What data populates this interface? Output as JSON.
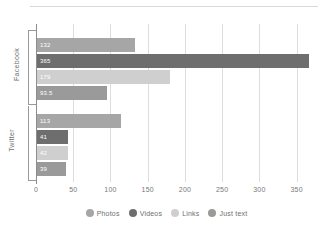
{
  "chart_data": {
    "type": "bar",
    "orientation": "horizontal",
    "title": "",
    "xlabel": "",
    "ylabel": "",
    "categories": [
      "Facebook",
      "Twitter"
    ],
    "series": [
      {
        "name": "Photos",
        "color": "#a6a6a6",
        "values": [
          132,
          113
        ]
      },
      {
        "name": "Videos",
        "color": "#6e6e6e",
        "values": [
          365,
          41
        ]
      },
      {
        "name": "Links",
        "color": "#cfcfcf",
        "values": [
          179,
          42
        ]
      },
      {
        "name": "Just text",
        "color": "#9a9a9a",
        "values": [
          93.5,
          39
        ]
      }
    ],
    "bar_labels": {
      "Facebook": [
        "132",
        "365",
        "179",
        "93.5"
      ],
      "Twitter": [
        "113",
        "41",
        "42",
        "39"
      ]
    },
    "xlim": [
      0,
      380
    ],
    "xticks": [
      0,
      50,
      100,
      150,
      200,
      250,
      300,
      350
    ],
    "xtick_labels": [
      "0",
      "50",
      "100",
      "150",
      "200",
      "250",
      "300",
      "350"
    ],
    "grid": true,
    "grid_axis": "x",
    "legend_position": "bottom"
  },
  "legend": {
    "items": [
      {
        "label": "Photos"
      },
      {
        "label": "Videos"
      },
      {
        "label": "Links"
      },
      {
        "label": "Just text"
      }
    ]
  },
  "axis": {
    "group_labels": [
      "Facebook",
      "Twitter"
    ]
  }
}
